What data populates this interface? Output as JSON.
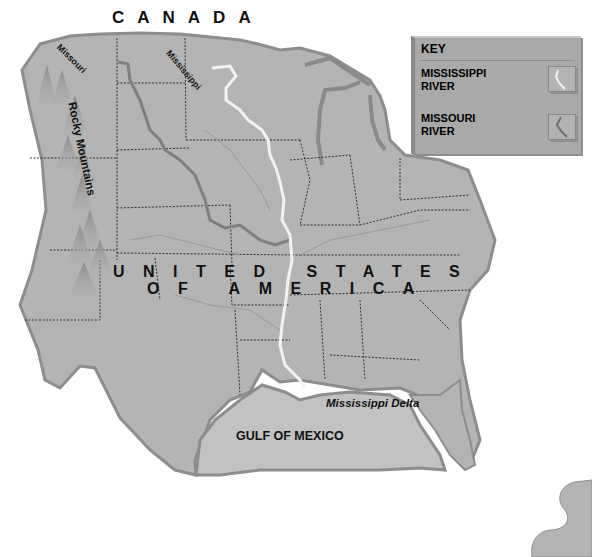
{
  "map": {
    "country_label": "CANADA",
    "usa_label_line1": "UNITED STATES",
    "usa_label_line2": "OF AMERICA",
    "labels": {
      "missouri": "Missouri",
      "mississippi": "Mississippi",
      "rocky_mountains": "Rocky Mountains",
      "mississippi_delta": "Mississippi Delta",
      "gulf": "GULF OF MEXICO"
    },
    "colors": {
      "land": "#b4b4b4",
      "land_edge": "#8d8d8d",
      "water": "#c8c8c8",
      "mississippi_river": "#f2f2f2",
      "missouri_river": "#7f7f7f",
      "borders": "#333333",
      "background": "#ffffff"
    }
  },
  "key": {
    "title": "KEY",
    "items": [
      {
        "line1": "MISSISSIPPI",
        "line2": "RIVER",
        "icon": "mississippi-river-swatch"
      },
      {
        "line1": "MISSOURI",
        "line2": "RIVER",
        "icon": "missouri-river-swatch"
      }
    ]
  }
}
